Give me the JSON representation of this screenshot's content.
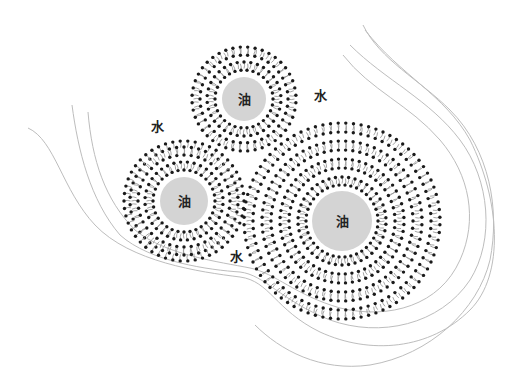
{
  "diagram": {
    "title": "",
    "background": "#ffffff",
    "oil_color": "#d4d4d4",
    "head_color": "#1a1a1a",
    "tail_color": "#9a9a9a",
    "boundary_color": "#bdbdbd",
    "droplets": [
      {
        "id": "top",
        "label": "油",
        "cx": 244,
        "cy": 99,
        "oil_r": 22,
        "rings": [
          {
            "r": 29,
            "dir": "in",
            "n": 30
          },
          {
            "r": 37,
            "dir": "out",
            "n": 34
          },
          {
            "r": 44,
            "dir": "in",
            "n": 38
          },
          {
            "r": 52,
            "dir": "out",
            "n": 44
          }
        ]
      },
      {
        "id": "left",
        "label": "油",
        "cx": 184,
        "cy": 201,
        "oil_r": 24,
        "rings": [
          {
            "r": 31,
            "dir": "in",
            "n": 32
          },
          {
            "r": 39,
            "dir": "out",
            "n": 36
          },
          {
            "r": 46,
            "dir": "in",
            "n": 40
          },
          {
            "r": 54,
            "dir": "out",
            "n": 46
          },
          {
            "r": 60,
            "dir": "out",
            "n": 50
          }
        ]
      },
      {
        "id": "large",
        "label": "油",
        "cx": 342,
        "cy": 221,
        "oil_r": 30,
        "rings": [
          {
            "r": 36,
            "dir": "in",
            "n": 38
          },
          {
            "r": 44,
            "dir": "out",
            "n": 42
          },
          {
            "r": 53,
            "dir": "in",
            "n": 50
          },
          {
            "r": 62,
            "dir": "out",
            "n": 56
          },
          {
            "r": 71,
            "dir": "in",
            "n": 62
          },
          {
            "r": 80,
            "dir": "out",
            "n": 68
          },
          {
            "r": 89,
            "dir": "in",
            "n": 74
          },
          {
            "r": 98,
            "dir": "out",
            "n": 80
          }
        ]
      }
    ],
    "water_labels": [
      {
        "text": "水",
        "x": 320,
        "y": 100
      },
      {
        "text": "水",
        "x": 157,
        "y": 131
      },
      {
        "text": "水",
        "x": 236,
        "y": 261
      }
    ],
    "boundaries": [
      "M28,128 C55,140 62,190 95,225 C130,262 200,272 240,277 C270,281 275,310 320,332 C370,355 430,350 470,310 C505,275 500,200 470,140 C445,95 400,75 365,30",
      "M72,105 C78,150 90,200 120,235 C150,262 210,270 240,272 C265,275 280,300 330,320 C380,338 440,325 470,280 C495,240 490,180 460,140 C430,100 385,80 350,45",
      "M88,112 C92,160 105,200 135,230 C165,255 220,262 250,268 C275,273 295,295 340,308 C390,320 440,305 460,260 C478,220 470,175 440,140 C410,105 370,90 343,55",
      "M363,25 C380,60 420,80 450,110 C490,150 500,210 490,260 C478,310 430,355 370,365 C320,372 280,350 255,325"
    ]
  }
}
